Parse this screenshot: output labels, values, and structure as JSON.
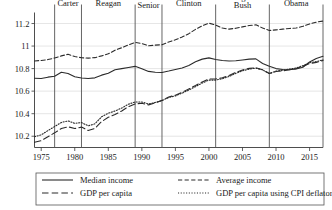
{
  "chart_data": {
    "type": "line",
    "title": "",
    "xlabel": "",
    "ylabel": "",
    "xlim": [
      1974,
      2017
    ],
    "ylim": [
      10.1,
      11.28
    ],
    "yticks": [
      "10.2",
      "10.4",
      "10.6",
      "10.8",
      "11",
      "11.2"
    ],
    "ytick_values": [
      10.2,
      10.4,
      10.6,
      10.8,
      11.0,
      11.2
    ],
    "xticks": [
      "1975",
      "1980",
      "1985",
      "1990",
      "1995",
      "2000",
      "2005",
      "2010",
      "2015"
    ],
    "xtick_values": [
      1975,
      1980,
      1985,
      1990,
      1995,
      2000,
      2005,
      2010,
      2015
    ],
    "grid": true,
    "legend_position": "below",
    "annotations": [
      {
        "label": "Carter",
        "start": 1977,
        "end": 1981
      },
      {
        "label": "Reagan",
        "start": 1981,
        "end": 1989
      },
      {
        "label": "Bush Senior",
        "start": 1989,
        "end": 1993
      },
      {
        "label": "Clinton",
        "start": 1993,
        "end": 2001
      },
      {
        "label": "George W. Bush",
        "start": 2001,
        "end": 2009
      },
      {
        "label": "Obama",
        "start": 2009,
        "end": 2017
      }
    ],
    "divider_years": [
      1977,
      1981,
      1989,
      1993,
      2001,
      2009,
      2017
    ],
    "x": [
      1974,
      1975,
      1976,
      1977,
      1978,
      1979,
      1980,
      1981,
      1982,
      1983,
      1984,
      1985,
      1986,
      1987,
      1988,
      1989,
      1990,
      1991,
      1992,
      1993,
      1994,
      1995,
      1996,
      1997,
      1998,
      1999,
      2000,
      2001,
      2002,
      2003,
      2004,
      2005,
      2006,
      2007,
      2008,
      2009,
      2010,
      2011,
      2012,
      2013,
      2014,
      2015,
      2016,
      2017
    ],
    "series": [
      {
        "name": "Median income",
        "style": "solid",
        "values": [
          10.715,
          10.712,
          10.724,
          10.732,
          10.768,
          10.757,
          10.727,
          10.716,
          10.712,
          10.718,
          10.742,
          10.758,
          10.79,
          10.8,
          10.81,
          10.82,
          10.799,
          10.775,
          10.768,
          10.766,
          10.778,
          10.792,
          10.806,
          10.828,
          10.86,
          10.884,
          10.895,
          10.881,
          10.872,
          10.868,
          10.869,
          10.876,
          10.884,
          10.886,
          10.846,
          10.82,
          10.8,
          10.792,
          10.79,
          10.797,
          10.812,
          10.858,
          10.89,
          10.91
        ]
      },
      {
        "name": "Average income",
        "style": "dashed",
        "values": [
          10.868,
          10.872,
          10.88,
          10.894,
          10.913,
          10.927,
          10.907,
          10.896,
          10.893,
          10.897,
          10.913,
          10.931,
          10.963,
          10.985,
          11.01,
          11.032,
          11.022,
          11.002,
          11.008,
          11.012,
          11.036,
          11.056,
          11.08,
          11.11,
          11.148,
          11.18,
          11.203,
          11.186,
          11.16,
          11.15,
          11.158,
          11.17,
          11.182,
          11.188,
          11.16,
          11.138,
          11.144,
          11.15,
          11.156,
          11.16,
          11.175,
          11.196,
          11.212,
          11.222
        ]
      },
      {
        "name": "GDP per capita",
        "style": "longdash",
        "values": [
          10.146,
          10.16,
          10.196,
          10.23,
          10.268,
          10.284,
          10.268,
          10.281,
          10.251,
          10.269,
          10.33,
          10.368,
          10.392,
          10.424,
          10.462,
          10.487,
          10.492,
          10.478,
          10.497,
          10.518,
          10.548,
          10.564,
          10.59,
          10.62,
          10.65,
          10.682,
          10.708,
          10.708,
          10.718,
          10.738,
          10.766,
          10.788,
          10.802,
          10.808,
          10.79,
          10.756,
          10.774,
          10.78,
          10.79,
          10.8,
          10.82,
          10.845,
          10.855,
          10.872
        ]
      },
      {
        "name": "GDP per capita using CPI deflator",
        "style": "dotted",
        "values": [
          10.196,
          10.212,
          10.25,
          10.286,
          10.322,
          10.336,
          10.314,
          10.322,
          10.292,
          10.31,
          10.372,
          10.404,
          10.424,
          10.45,
          10.484,
          10.504,
          10.504,
          10.486,
          10.5,
          10.516,
          10.544,
          10.558,
          10.582,
          10.61,
          10.64,
          10.672,
          10.698,
          10.698,
          10.71,
          10.73,
          10.758,
          10.78,
          10.796,
          10.804,
          10.788,
          10.756,
          10.778,
          10.786,
          10.796,
          10.806,
          10.826,
          10.852,
          10.862,
          10.878
        ]
      }
    ],
    "legend": [
      {
        "label": "Median income",
        "style": "solid"
      },
      {
        "label": "Average income",
        "style": "dashed"
      },
      {
        "label": "GDP per capita",
        "style": "longdash"
      },
      {
        "label": "GDP per capita using CPI deflator",
        "style": "dotted"
      }
    ]
  }
}
